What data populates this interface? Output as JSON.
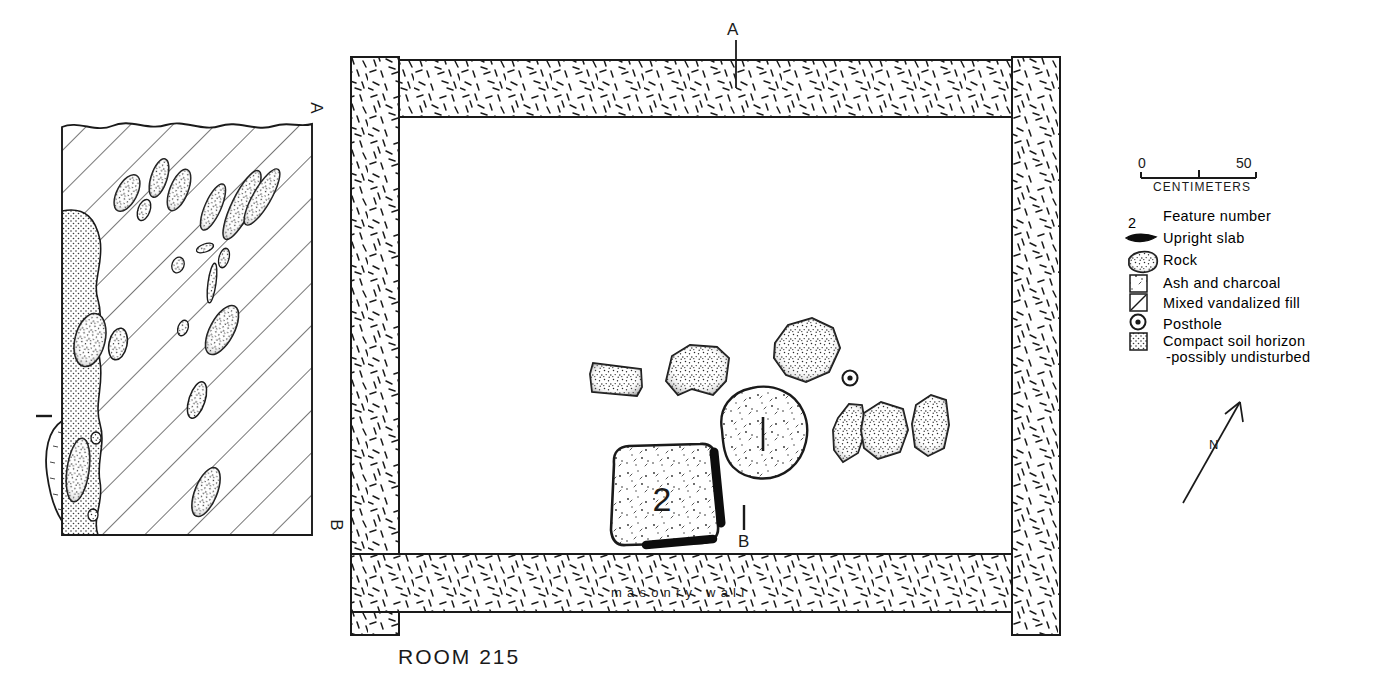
{
  "figure": {
    "room_title": "ROOM 215",
    "masonry_wall_label": "masonry  wall",
    "ink_color": "#111111",
    "background_color": "#ffffff"
  },
  "section_markers": {
    "plan_top": "A",
    "plan_bottom": "B",
    "profile_top": "A",
    "profile_bottom": "B"
  },
  "plan_features": [
    {
      "number": "1",
      "name": "hearth-feature-1",
      "fill": "ash-and-charcoal"
    },
    {
      "number": "2",
      "name": "hearth-feature-2",
      "fill": "ash-and-charcoal"
    }
  ],
  "profile_features": [
    {
      "number": "1",
      "name": "profile-feature-1"
    }
  ],
  "scale_bar": {
    "min": "0",
    "max": "50",
    "units": "CENTIMETERS"
  },
  "north_arrow": {
    "label": "N"
  },
  "legend": {
    "items": [
      {
        "symbol": "feature-number",
        "symbol_text": "2",
        "label": "Feature number"
      },
      {
        "symbol": "upright-slab",
        "symbol_text": "",
        "label": "Upright slab"
      },
      {
        "symbol": "rock",
        "symbol_text": "",
        "label": "Rock"
      },
      {
        "symbol": "ash-and-charcoal",
        "symbol_text": "",
        "label": "Ash and charcoal"
      },
      {
        "symbol": "mixed-vandalized-fill",
        "symbol_text": "",
        "label": "Mixed vandalized fill"
      },
      {
        "symbol": "posthole",
        "symbol_text": "",
        "label": "Posthole"
      },
      {
        "symbol": "compact-soil-horizon",
        "symbol_text": "",
        "label": "Compact soil horizon"
      }
    ],
    "compact_soil_subtext": "-possibly undisturbed"
  }
}
